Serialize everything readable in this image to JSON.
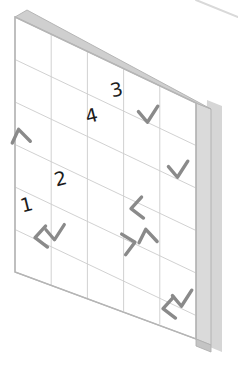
{
  "scene": {
    "title": "Isometric whiteboard grid panel",
    "background_color": "#ffffff",
    "panel_fill": "#ffffff",
    "panel_border_color": "#b5b5b5",
    "grid_line_color": "#cccccc",
    "frame_edge_color": "#cfcfcf",
    "shadow_color": "#d6d6d6",
    "mark_color": "#8a8a8a",
    "digit_color": "#1c1c1c",
    "grid_columns": 5,
    "grid_rows": 6
  },
  "background_decoration": {
    "name": "diagonal-line",
    "color": "#d9d9d9"
  },
  "digits": [
    {
      "label": "3",
      "col": 3,
      "row": 1,
      "x": 118,
      "y": 96,
      "rotate": -14
    },
    {
      "label": "4",
      "col": 2,
      "row": 2,
      "x": 93,
      "y": 122,
      "rotate": -14
    },
    {
      "label": "2",
      "col": 1,
      "row": 3,
      "x": 62,
      "y": 185,
      "rotate": -14
    },
    {
      "label": "1",
      "col": 0,
      "row": 4,
      "x": 28,
      "y": 211,
      "rotate": -14
    }
  ],
  "marks": [
    {
      "name": "caret-up-mark",
      "shape": "caret-up",
      "x": 21,
      "y": 136,
      "scale": 1.0,
      "rotate": -12
    },
    {
      "name": "check-mark-1",
      "shape": "check",
      "x": 148,
      "y": 114,
      "scale": 1.0,
      "rotate": -10
    },
    {
      "name": "check-mark-2",
      "shape": "check",
      "x": 178,
      "y": 169,
      "scale": 1.0,
      "rotate": -10
    },
    {
      "name": "chevron-left-1",
      "shape": "chevron-left",
      "x": 136,
      "y": 208,
      "scale": 1.0,
      "rotate": -8
    },
    {
      "name": "chevron-left-2",
      "shape": "chevron-left",
      "x": 40,
      "y": 237,
      "scale": 1.0,
      "rotate": -8
    },
    {
      "name": "check-mark-3",
      "shape": "check",
      "x": 55,
      "y": 232,
      "scale": 0.95,
      "rotate": -10
    },
    {
      "name": "chevron-right-1",
      "shape": "chevron-right",
      "x": 130,
      "y": 243,
      "scale": 1.0,
      "rotate": -8
    },
    {
      "name": "caret-up-2",
      "shape": "caret-up",
      "x": 148,
      "y": 236,
      "scale": 1.0,
      "rotate": -10
    },
    {
      "name": "chevron-left-3",
      "shape": "chevron-left",
      "x": 168,
      "y": 308,
      "scale": 1.0,
      "rotate": -8
    },
    {
      "name": "check-mark-4",
      "shape": "check",
      "x": 182,
      "y": 298,
      "scale": 1.0,
      "rotate": -10
    }
  ]
}
